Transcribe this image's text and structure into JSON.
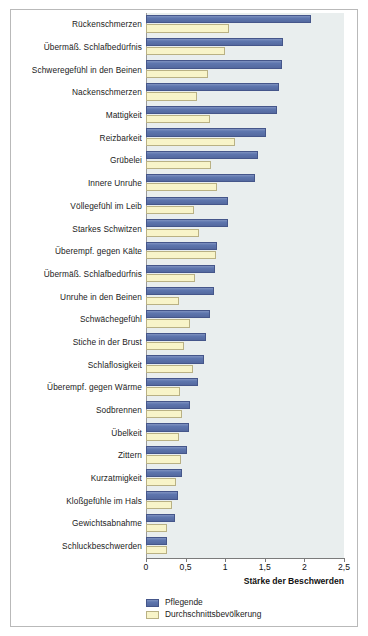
{
  "chart_data": {
    "type": "bar",
    "orientation": "horizontal",
    "title": "",
    "xlabel": "Stärke der Beschwerden",
    "ylabel": "",
    "xlim": [
      0,
      2.5
    ],
    "xticks": [
      "0",
      "0,5",
      "1",
      "1,5",
      "2",
      "2,5"
    ],
    "xtick_values": [
      0,
      0.5,
      1,
      1.5,
      2,
      2.5
    ],
    "grid": false,
    "legend_position": "bottom-left",
    "categories": [
      "Rückenschmerzen",
      "Übermäß. Schlafbedürfnis",
      "Schweregefühl in den Beinen",
      "Nackenschmerzen",
      "Mattigkeit",
      "Reizbarkeit",
      "Grübelei",
      "Innere Unruhe",
      "Völlegefühl im Leib",
      "Starkes Schwitzen",
      "Überempf. gegen Kälte",
      "Übermäß. Schlafbedürfnis",
      "Unruhe in den Beinen",
      "Schwächegefühl",
      "Stiche in der Brust",
      "Schlaflosigkeit",
      "Überempf. gegen Wärme",
      "Sodbrennen",
      "Übelkeit",
      "Zittern",
      "Kurzatmigkeit",
      "Kloßgefühle im Hals",
      "Gewichtsabnahme",
      "Schluckbeschwerden"
    ],
    "series": [
      {
        "name": "Pflegende",
        "color": "#5e76ae",
        "values": [
          2.08,
          1.73,
          1.72,
          1.68,
          1.66,
          1.52,
          1.41,
          1.38,
          1.03,
          1.03,
          0.9,
          0.87,
          0.86,
          0.81,
          0.76,
          0.73,
          0.66,
          0.56,
          0.54,
          0.52,
          0.45,
          0.41,
          0.37,
          0.26
        ]
      },
      {
        "name": "Durchschnittsbevölkerung",
        "color": "#f8f4c9",
        "values": [
          1.05,
          1.0,
          0.78,
          0.65,
          0.81,
          1.13,
          0.82,
          0.9,
          0.6,
          0.67,
          0.89,
          0.62,
          0.42,
          0.55,
          0.48,
          0.59,
          0.43,
          0.46,
          0.42,
          0.44,
          0.38,
          0.33,
          0.27,
          0.27
        ]
      }
    ]
  },
  "legend": {
    "items": [
      {
        "label": "Pflegende"
      },
      {
        "label": "Durchschnittsbevölkerung"
      }
    ]
  },
  "axis": {
    "title": "Stärke der Beschwerden"
  },
  "colors": {
    "series_blue": "#5e76ae",
    "series_yellow": "#f8f4c9",
    "plot_background": "#e9eeee",
    "frame": "#b9b9b9",
    "axis": "#7b7b7b"
  }
}
